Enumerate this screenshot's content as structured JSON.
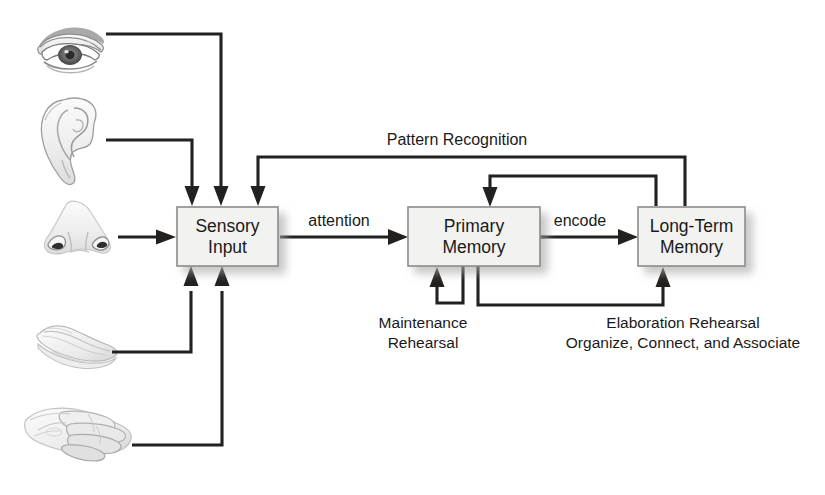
{
  "diagram": {
    "background_color": "#ffffff",
    "line_color": "#23211f",
    "box_fill": "#f2f2f0",
    "box_border": "#8b8b8b",
    "nodes": [
      {
        "id": "sensory",
        "label_line1": "Sensory",
        "label_line2": "Input"
      },
      {
        "id": "primary",
        "label_line1": "Primary",
        "label_line2": "Memory"
      },
      {
        "id": "longterm",
        "label_line1": "Long-Term",
        "label_line2": "Memory"
      }
    ],
    "edge_labels": {
      "attention": "attention",
      "encode": "encode",
      "pattern_recognition": "Pattern Recognition"
    },
    "captions": {
      "maintenance_line1": "Maintenance",
      "maintenance_line2": "Rehearsal",
      "elaboration_line1": "Elaboration Rehearsal",
      "elaboration_line2": "Organize, Connect, and Associate"
    },
    "senses": [
      {
        "id": "eye",
        "icon": "eye-icon",
        "name": "sight"
      },
      {
        "id": "ear",
        "icon": "ear-icon",
        "name": "hearing"
      },
      {
        "id": "nose",
        "icon": "nose-icon",
        "name": "smell"
      },
      {
        "id": "tongue",
        "icon": "tongue-icon",
        "name": "taste"
      },
      {
        "id": "hand",
        "icon": "hand-icon",
        "name": "touch"
      }
    ]
  }
}
